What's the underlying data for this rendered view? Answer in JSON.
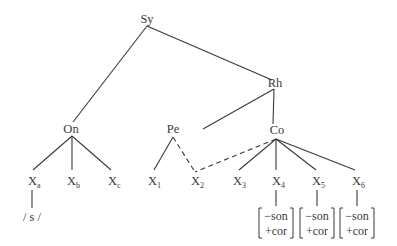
{
  "diagram": {
    "type": "syllable-structure-tree",
    "nodes": {
      "syllable": "Sy",
      "rhyme": "Rh",
      "onset": "On",
      "peak": "Pe",
      "coda": "Co"
    },
    "onset_slots": [
      {
        "base": "X",
        "sub": "a"
      },
      {
        "base": "X",
        "sub": "b"
      },
      {
        "base": "X",
        "sub": "c"
      }
    ],
    "rhyme_slots": [
      {
        "base": "X",
        "sub": "1"
      },
      {
        "base": "X",
        "sub": "2"
      },
      {
        "base": "X",
        "sub": "3"
      },
      {
        "base": "X",
        "sub": "4"
      },
      {
        "base": "X",
        "sub": "5"
      },
      {
        "base": "X",
        "sub": "6"
      }
    ],
    "segment_under_xa": "/ s /",
    "feature_matrices": [
      {
        "under": "X4",
        "features": [
          "−son",
          "+cor"
        ]
      },
      {
        "under": "X5",
        "features": [
          "−son",
          "+cor"
        ]
      },
      {
        "under": "X6",
        "features": [
          "−son",
          "+cor"
        ]
      }
    ],
    "edges": [
      {
        "from": "Sy",
        "to": "On",
        "style": "solid"
      },
      {
        "from": "Sy",
        "to": "Rh",
        "style": "solid"
      },
      {
        "from": "Rh",
        "to": "Pe",
        "style": "solid"
      },
      {
        "from": "Rh",
        "to": "Co",
        "style": "solid"
      },
      {
        "from": "On",
        "to": "Xa",
        "style": "solid"
      },
      {
        "from": "On",
        "to": "Xb",
        "style": "solid"
      },
      {
        "from": "On",
        "to": "Xc",
        "style": "solid"
      },
      {
        "from": "Pe",
        "to": "X1",
        "style": "solid"
      },
      {
        "from": "Pe",
        "to": "X2",
        "style": "dashed"
      },
      {
        "from": "Co",
        "to": "X2",
        "style": "dashed"
      },
      {
        "from": "Co",
        "to": "X3",
        "style": "solid"
      },
      {
        "from": "Co",
        "to": "X4",
        "style": "solid"
      },
      {
        "from": "Co",
        "to": "X5",
        "style": "solid"
      },
      {
        "from": "Co",
        "to": "X6",
        "style": "solid"
      }
    ]
  }
}
